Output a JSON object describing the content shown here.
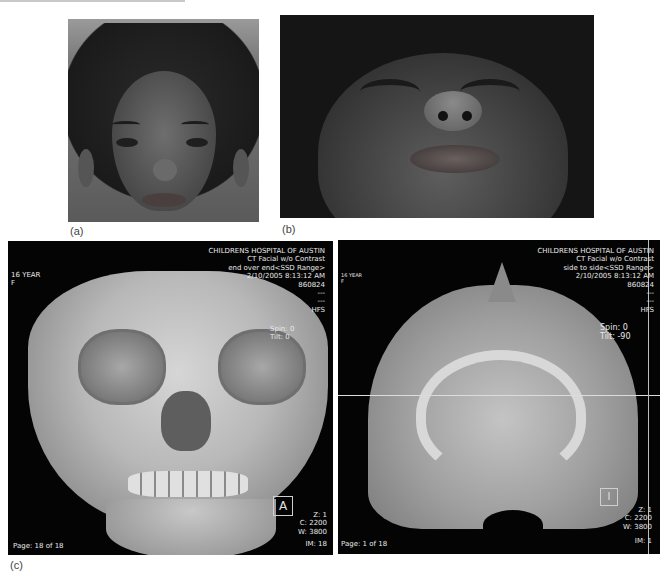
{
  "figure": {
    "panels": [
      {
        "id": "a",
        "caption": "(a)",
        "description": "frontal facial photograph"
      },
      {
        "id": "b",
        "caption": "(b)",
        "description": "worm's-eye view facial photograph"
      },
      {
        "id": "c",
        "caption": "(c)",
        "description": "3D CT reconstructions"
      }
    ]
  },
  "ct_left": {
    "header": {
      "institution": "CHILDRENS HOSPITAL OF AUSTIN",
      "study": "CT Facial w/o Contrast",
      "series": "end over end<SSD Range>",
      "datetime": "2/10/2005 8:13:12 AM",
      "id": "860824",
      "blank1": "---",
      "blank2": "---",
      "position": "HFS"
    },
    "patient": {
      "age": "16 YEAR",
      "sex": "F"
    },
    "spin_label": "Spin:",
    "spin_value": "0",
    "tilt_label": "Tilt:",
    "tilt_value": "0",
    "orientation": "A",
    "zoom": "Z: 1",
    "center": "C: 2200",
    "width": "W: 3800",
    "page": "Page: 18 of 18",
    "image_number": "IM: 18"
  },
  "ct_right": {
    "header": {
      "institution": "CHILDRENS HOSPITAL OF AUSTIN",
      "study": "CT Facial w/o Contrast",
      "series": "side to side<SSD Range>",
      "datetime": "2/10/2005 8:13:12 AM",
      "id": "860824",
      "blank1": "---",
      "blank2": "---",
      "position": "HFS"
    },
    "patient": {
      "age": "16 YEAR",
      "sex": "F"
    },
    "spin_label": "Spin:",
    "spin_value": "0",
    "tilt_label": "Tilt:",
    "tilt_value": "-90",
    "orientation": "I",
    "zoom": "Z: 1",
    "center": "C: 2200",
    "width": "W: 3800",
    "page": "Page: 1 of 18",
    "image_number": "IM: 1"
  },
  "colors": {
    "ct_background": "#040404",
    "ct_overlay_text": "#e8e8e8",
    "page_background": "#ffffff"
  }
}
